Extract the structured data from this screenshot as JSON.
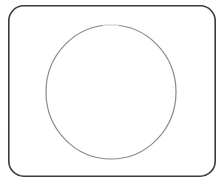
{
  "document": {
    "title": "Shape Drawing",
    "canvas": {
      "width": 224,
      "height": 183,
      "background_color": "#ffffff"
    }
  },
  "shapes": [
    {
      "id": "frame",
      "name": "rounded-rectangle-frame",
      "type": "rounded-rectangle",
      "x": 8,
      "y": 5,
      "width": 208,
      "height": 172,
      "corner_radius": 15,
      "stroke_color": "#3a3a3a",
      "stroke_width": 1.6,
      "fill": "none"
    },
    {
      "id": "circle",
      "name": "circle-outline",
      "type": "circle",
      "center_x": 111,
      "center_y": 92,
      "radius_x": 65,
      "radius_y": 67,
      "stroke_color": "#8a8a8a",
      "stroke_width": 1.2,
      "fill": "none",
      "gap_top": true
    }
  ],
  "palette": {
    "background": "#ffffff",
    "frame_stroke": "#3a3a3a",
    "circle_stroke": "#8a8a8a",
    "circle_stroke_light": "#c9c9c9"
  }
}
